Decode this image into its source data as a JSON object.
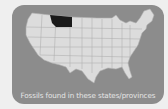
{
  "map": {
    "title": "United States map",
    "highlighted_regions": [
      "Montana"
    ],
    "highlight_color": "#1a1a1a",
    "land_color": "#dcdcdc",
    "border_color": "#a8a8a8",
    "background_color": "#8c8c8c"
  },
  "caption": "Fossils found in these states/provinces"
}
